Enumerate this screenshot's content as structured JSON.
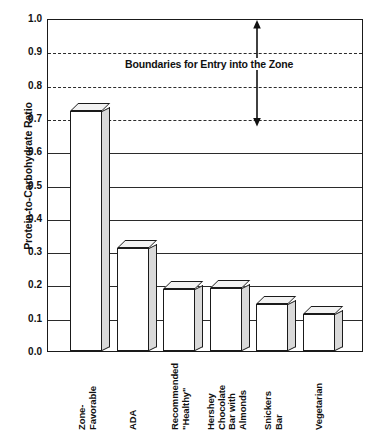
{
  "chart_data": {
    "type": "bar",
    "title": "",
    "xlabel": "",
    "ylabel": "Protein-to-Carbohydrate Ratio",
    "ylim": [
      0.0,
      1.0
    ],
    "ytick_labels": [
      "1.0",
      "0.9",
      "0.8",
      "0.7",
      "0.6",
      "0.5",
      "0.4",
      "0.3",
      "0.2",
      "0.1",
      "0.0"
    ],
    "ytick_values": [
      1.0,
      0.9,
      0.8,
      0.7,
      0.6,
      0.5,
      0.4,
      0.3,
      0.2,
      0.1,
      0.0
    ],
    "grid": {
      "solid_at": [
        0.6,
        0.5,
        0.4,
        0.3,
        0.2,
        0.1
      ],
      "dashed_at": [
        0.9,
        0.8,
        0.7
      ],
      "legend_position": "none"
    },
    "categories": [
      "Zone-Favorable",
      "ADA",
      "Recommended \"Healthy\"",
      "Hershey Chocolate Bar with Almonds",
      "Snickers Bar",
      "Vegetarian"
    ],
    "category_lines": [
      [
        "Zone-",
        "Favorable"
      ],
      [
        "ADA"
      ],
      [
        "Recommended",
        "\"Healthy\""
      ],
      [
        "Hershey",
        "Chocolate",
        "Bar with",
        "Almonds"
      ],
      [
        "Snickers",
        "Bar"
      ],
      [
        "Vegetarian"
      ]
    ],
    "values": [
      0.72,
      0.31,
      0.185,
      0.19,
      0.14,
      0.11
    ],
    "annotations": [
      {
        "text": "Boundaries for Entry into the Zone",
        "arrow": "double-headed-vertical",
        "arrow_from": 1.0,
        "arrow_to": 0.68
      }
    ]
  },
  "axis": {
    "y_title": "Protein-to-Carbohydrate Ratio"
  },
  "annotation": {
    "label": "Boundaries for Entry into the Zone"
  },
  "colors": {
    "axis": "#1a1a1a",
    "grid": "#2b2b2b",
    "bar_front": "#ffffff",
    "bar_side": "#d9d9d9",
    "bar_top": "#f2f2f2",
    "background": "#ffffff"
  }
}
